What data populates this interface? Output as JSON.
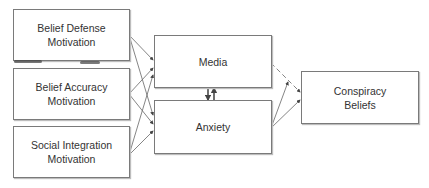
{
  "diagram": {
    "type": "path-model",
    "nodes": [
      {
        "id": "belief_defense",
        "label": "Belief Defense\nMotivation",
        "column": "predictors"
      },
      {
        "id": "belief_accuracy",
        "label": "Belief Accuracy\nMotivation",
        "column": "predictors"
      },
      {
        "id": "social_integration",
        "label": "Social Integration\nMotivation",
        "column": "predictors"
      },
      {
        "id": "media",
        "label": "Media",
        "column": "mediators"
      },
      {
        "id": "anxiety",
        "label": "Anxiety",
        "column": "mediators"
      },
      {
        "id": "conspiracy_beliefs",
        "label": "Conspiracy\nBeliefs",
        "column": "outcome"
      }
    ],
    "edges": [
      {
        "from": "belief_defense",
        "to": "media",
        "style": "solid"
      },
      {
        "from": "belief_defense",
        "to": "anxiety",
        "style": "solid"
      },
      {
        "from": "belief_accuracy",
        "to": "media",
        "style": "solid"
      },
      {
        "from": "belief_accuracy",
        "to": "anxiety",
        "style": "solid"
      },
      {
        "from": "social_integration",
        "to": "media",
        "style": "solid"
      },
      {
        "from": "social_integration",
        "to": "anxiety",
        "style": "solid"
      },
      {
        "from": "media",
        "to": "anxiety",
        "style": "solid"
      },
      {
        "from": "anxiety",
        "to": "media",
        "style": "solid"
      },
      {
        "from": "media",
        "to": "conspiracy_beliefs",
        "style": "dashed"
      },
      {
        "from": "anxiety",
        "to": "conspiracy_beliefs",
        "style": "solid"
      },
      {
        "from": "anxiety",
        "to": "conspiracy_beliefs",
        "style": "solid"
      }
    ],
    "colors": {
      "line": "#555555",
      "border": "#7a7a7a",
      "text": "#333333"
    }
  }
}
